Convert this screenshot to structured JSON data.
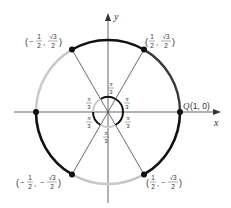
{
  "diagram": {
    "type": "unit-circle-partition",
    "axes": {
      "x_label": "x",
      "y_label": "y"
    },
    "start_point": {
      "name": "Q",
      "coords": "(1, 0)"
    },
    "angle_label": {
      "numerator": "π",
      "denominator": "3"
    },
    "points": [
      {
        "id": "p60",
        "x_num": "1",
        "x_den": "2",
        "y_num": "√3",
        "y_den": "2",
        "x_sign": "",
        "y_sign": ""
      },
      {
        "id": "p120",
        "x_num": "1",
        "x_den": "2",
        "y_num": "√3",
        "y_den": "2",
        "x_sign": "−",
        "y_sign": ""
      },
      {
        "id": "p240",
        "x_num": "1",
        "x_den": "2",
        "y_num": "√3",
        "y_den": "2",
        "x_sign": "−",
        "y_sign": "−"
      },
      {
        "id": "p300",
        "x_num": "1",
        "x_den": "2",
        "y_num": "√3",
        "y_den": "2",
        "x_sign": "",
        "y_sign": "−"
      }
    ],
    "colors": {
      "black": "#111111",
      "dark": "#3a3a3a",
      "light": "#c8c8c8",
      "axis": "#555555",
      "line": "#444444"
    }
  }
}
